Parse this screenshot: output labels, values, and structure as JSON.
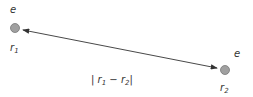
{
  "particle1": {
    "charge_label": "e",
    "position_label": "r",
    "position_sub": "1"
  },
  "particle2": {
    "charge_label": "e",
    "position_label": "r",
    "position_sub": "2"
  },
  "distance": {
    "prefix": "| r",
    "sub1": "1",
    "minus": " − r",
    "sub2": "2",
    "suffix": "|"
  },
  "colors": {
    "particle": "#a0a0a0",
    "particle_stroke": "#707070",
    "line": "#333333",
    "text": "#333333"
  }
}
